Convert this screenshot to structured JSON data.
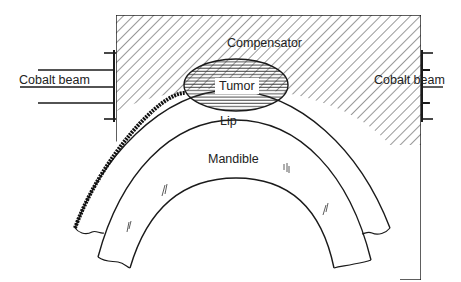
{
  "diagram": {
    "type": "anatomical schematic",
    "labels": {
      "compensator": "Compensator",
      "tumor": "Tumor",
      "lip": "Lip",
      "mandible": "Mandible",
      "cobalt_beam_left": "Cobalt beam",
      "cobalt_beam_right": "Cobalt beam"
    },
    "colors": {
      "line": "#1a1a1a",
      "background": "#ffffff"
    }
  }
}
